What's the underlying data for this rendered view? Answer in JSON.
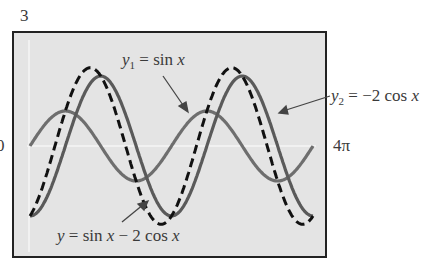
{
  "chart_data": {
    "type": "line",
    "title": "",
    "xlabel": "",
    "ylabel": "",
    "xlim": [
      0,
      12.566
    ],
    "ylim": [
      -3,
      3
    ],
    "x_tick_labels": {
      "left": "0",
      "right": "4π"
    },
    "y_tick_labels": {
      "top": "3"
    },
    "grid": false,
    "series": [
      {
        "name": "y1 = sin x",
        "expr": "sin(x)",
        "style": "solid",
        "color": "#6e6e6e"
      },
      {
        "name": "y2 = -2 cos x",
        "expr": "-2*cos(x)",
        "style": "solid",
        "color": "#5a5a5a"
      },
      {
        "name": "y = sin x - 2 cos x",
        "expr": "sin(x) - 2*cos(x)",
        "style": "dashed",
        "color": "#111111"
      }
    ],
    "annotations": [
      {
        "text": "y1 = sin x",
        "arrow_to": "y1"
      },
      {
        "text": "y2 = −2 cos x",
        "arrow_to": "y2"
      },
      {
        "text": "y = sin x − 2 cos x",
        "arrow_to": "y"
      }
    ]
  },
  "labels": {
    "ymax": "3",
    "xmin": "0",
    "xmax": "4π",
    "y1": {
      "pre": "y",
      "sub": "1",
      "post": " = sin ",
      "var": "x"
    },
    "y2": {
      "pre": "y",
      "sub": "2",
      "post": " = −2 cos ",
      "var": "x"
    },
    "sum": "y = sin x − 2 cos x"
  }
}
